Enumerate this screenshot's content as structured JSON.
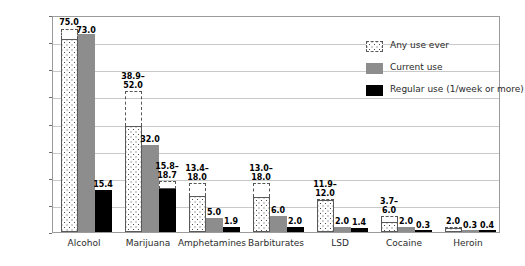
{
  "chart_data": {
    "type": "bar",
    "title": "",
    "xlabel": "",
    "ylabel": "Percent",
    "ylim": [
      0,
      80
    ],
    "yticks": [
      0,
      10,
      20,
      30,
      40,
      50,
      60,
      70,
      80
    ],
    "grid": true,
    "legend_position": "top-right",
    "categories": [
      "Alcohol",
      "Marijuana",
      "Amphetamines",
      "Barbiturates",
      "LSD",
      "Cocaine",
      "Heroin"
    ],
    "series": [
      {
        "name": "Any use ever",
        "pattern": "dotted",
        "color": "#ffffff",
        "values": [
          75.0,
          52.0,
          18.0,
          18.0,
          12.0,
          6.0,
          2.0
        ],
        "range_low": [
          71.0,
          38.9,
          13.4,
          13.0,
          11.9,
          3.7,
          1.6
        ],
        "range_high": [
          75.0,
          52.0,
          18.0,
          18.0,
          12.0,
          6.0,
          2.0
        ],
        "labels": [
          "75.0",
          "38.9–\n52.0",
          "13.4–\n18.0",
          "13.0–\n18.0",
          "11.9–\n12.0",
          "3.7–\n6.0",
          "2.0"
        ]
      },
      {
        "name": "Current use",
        "pattern": "solid",
        "color": "#8d8d8d",
        "values": [
          73.0,
          32.0,
          5.0,
          6.0,
          2.0,
          2.0,
          0.3
        ],
        "labels": [
          "73.0",
          "32.0",
          "5.0",
          "6.0",
          "2.0",
          "2.0",
          "0.3"
        ]
      },
      {
        "name": "Regular use (1/week or more)",
        "pattern": "solid",
        "color": "#000000",
        "values": [
          15.4,
          18.7,
          1.9,
          2.0,
          1.4,
          0.3,
          0.4
        ],
        "range_low": [
          15.4,
          15.8,
          1.9,
          2.0,
          1.4,
          0.3,
          0.4
        ],
        "range_high": [
          15.4,
          18.7,
          1.9,
          2.0,
          1.4,
          0.3,
          0.4
        ],
        "labels": [
          "15.4",
          "15.8–\n18.7",
          "1.9",
          "2.0",
          "1.4",
          "0.3",
          "0.4"
        ]
      }
    ]
  },
  "legend": {
    "items": [
      {
        "label": "Any use ever",
        "swatch": "dotted-swatch"
      },
      {
        "label": "Current use",
        "swatch": "gray-swatch"
      },
      {
        "label": "Regular use (1/week or more)",
        "swatch": "black-swatch"
      }
    ]
  },
  "axis": {
    "y_label": "Percent",
    "y_ticks": [
      "0",
      "10",
      "20",
      "30",
      "40",
      "50",
      "60",
      "70",
      "80"
    ],
    "x_ticks": [
      "Alcohol",
      "Marijuana",
      "Amphetamines",
      "Barbiturates",
      "LSD",
      "Cocaine",
      "Heroin"
    ]
  },
  "value_labels": {
    "alcohol_any": "75.0",
    "alcohol_current": "73.0",
    "alcohol_regular": "15.4",
    "marijuana_any_low": "38.9–",
    "marijuana_any_high": "52.0",
    "marijuana_current": "32.0",
    "marijuana_regular_low": "15.8–",
    "marijuana_regular_high": "18.7",
    "amphetamines_any_low": "13.4–",
    "amphetamines_any_high": "18.0",
    "amphetamines_current": "5.0",
    "amphetamines_regular": "1.9",
    "barbiturates_any_low": "13.0–",
    "barbiturates_any_high": "18.0",
    "barbiturates_current": "6.0",
    "barbiturates_regular": "2.0",
    "lsd_any_low": "11.9–",
    "lsd_any_high": "12.0",
    "lsd_current": "2.0",
    "lsd_regular": "1.4",
    "cocaine_any_low": "3.7–",
    "cocaine_any_high": "6.0",
    "cocaine_current": "2.0",
    "cocaine_regular": "0.3",
    "heroin_any": "2.0",
    "heroin_current": "0.3",
    "heroin_regular": "0.4"
  }
}
